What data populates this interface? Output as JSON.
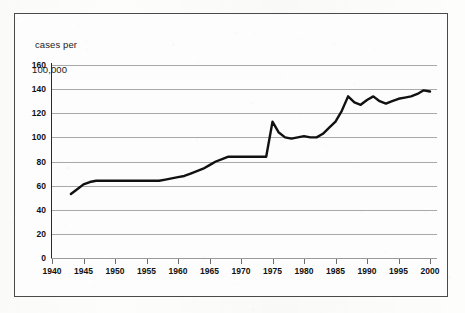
{
  "figure": {
    "axis_title_line1": "cases per",
    "axis_title_line2": "100,000",
    "frame_color": "#4a4a4a",
    "grid_color": "#a9a9a9",
    "series_color": "#111111",
    "background_color": "#fdfdfd"
  },
  "chart_data": {
    "type": "line",
    "title": "",
    "subtitle": "",
    "xlabel": "",
    "ylabel": "cases per 100,000",
    "xlim": [
      1940,
      2000
    ],
    "ylim": [
      0,
      160
    ],
    "ytick_labels": [
      "0",
      "20",
      "40",
      "60",
      "80",
      "100",
      "120",
      "140",
      "160"
    ],
    "yticks": [
      0,
      20,
      40,
      60,
      80,
      100,
      120,
      140,
      160
    ],
    "xtick_labels": [
      "1940",
      "1945",
      "1950",
      "1955",
      "1960",
      "1965",
      "1970",
      "1975",
      "1980",
      "1985",
      "1990",
      "1995",
      "2000"
    ],
    "xticks": [
      1940,
      1945,
      1950,
      1955,
      1960,
      1965,
      1970,
      1975,
      1980,
      1985,
      1990,
      1995,
      2000
    ],
    "grid": "horizontal",
    "legend": "none",
    "series": [
      {
        "name": "cases per 100,000",
        "x": [
          1943,
          1944,
          1945,
          1946,
          1947,
          1948,
          1949,
          1950,
          1951,
          1952,
          1953,
          1954,
          1955,
          1956,
          1957,
          1958,
          1959,
          1960,
          1961,
          1962,
          1963,
          1964,
          1965,
          1966,
          1967,
          1968,
          1969,
          1970,
          1971,
          1972,
          1973,
          1974,
          1975,
          1976,
          1977,
          1978,
          1979,
          1980,
          1981,
          1982,
          1983,
          1984,
          1985,
          1986,
          1987,
          1988,
          1989,
          1990,
          1991,
          1992,
          1993,
          1994,
          1995,
          1996,
          1997,
          1998,
          1999,
          2000
        ],
        "values": [
          53,
          57,
          61,
          63,
          64,
          64,
          64,
          64,
          64,
          64,
          64,
          64,
          64,
          64,
          64,
          65,
          66,
          67,
          68,
          70,
          72,
          74,
          77,
          80,
          82,
          84,
          84,
          84,
          84,
          84,
          84,
          84,
          113,
          104,
          100,
          99,
          100,
          101,
          100,
          100,
          103,
          108,
          113,
          122,
          134,
          129,
          127,
          131,
          134,
          130,
          128,
          130,
          132,
          133,
          134,
          136,
          139,
          138
        ]
      }
    ]
  }
}
